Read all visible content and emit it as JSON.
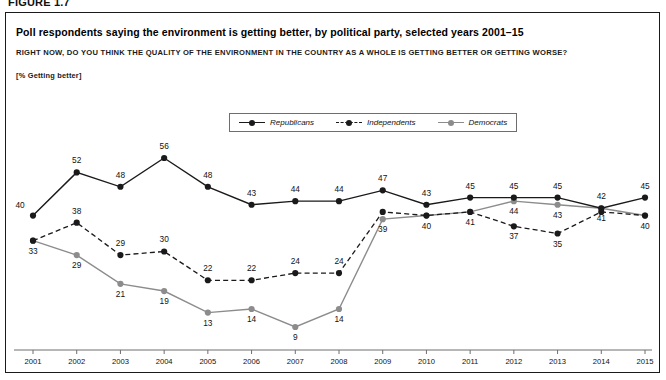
{
  "figure": {
    "label": "FIGURE 1.7",
    "title": "Poll respondents saying the environment is getting better, by political party, selected years 2001–15",
    "subtitle": "RIGHT NOW, DO YOU THINK THE QUALITY OF THE ENVIRONMENT IN THE COUNTRY AS A WHOLE IS GETTING BETTER OR GETTING WORSE?",
    "unit_note": "[% Getting better]"
  },
  "colors": {
    "republicans": "#1a1a1a",
    "independents": "#1a1a1a",
    "democrats": "#8c8c8c",
    "axis": "#6e6e6e",
    "border": "#1a1a1a",
    "text": "#111111"
  },
  "legend": {
    "position": "top-center",
    "items": [
      {
        "label": "Republicans",
        "marker": "solid-line-dot",
        "color": "#1a1a1a",
        "style": "solid"
      },
      {
        "label": "Independents",
        "marker": "dashed-line-dot",
        "color": "#1a1a1a",
        "style": "dashed"
      },
      {
        "label": "Democrats",
        "marker": "solid-line-dot",
        "color": "#8c8c8c",
        "style": "solid"
      }
    ]
  },
  "chart_data": {
    "type": "line",
    "title": "Poll respondents saying the environment is getting better, by political party, selected years 2001–15",
    "subtitle": "RIGHT NOW, DO YOU THINK THE QUALITY OF THE ENVIRONMENT IN THE COUNTRY AS A WHOLE IS GETTING BETTER OR GETTING WORSE?",
    "xlabel": "",
    "ylabel": "% Getting better",
    "x": [
      2001,
      2002,
      2003,
      2004,
      2005,
      2006,
      2007,
      2008,
      2009,
      2010,
      2011,
      2012,
      2013,
      2014,
      2015
    ],
    "categories": [
      "2001",
      "2002",
      "2003",
      "2004",
      "2005",
      "2006",
      "2007",
      "2008",
      "2009",
      "2010",
      "2011",
      "2012",
      "2013",
      "2014",
      "2015"
    ],
    "ylim": [
      0,
      60
    ],
    "grid": false,
    "y_axis_visible": false,
    "series": [
      {
        "name": "Republicans",
        "color": "#1a1a1a",
        "style": "solid",
        "values": [
          40,
          52,
          48,
          56,
          48,
          43,
          44,
          44,
          47,
          43,
          45,
          45,
          45,
          42,
          45
        ],
        "labels": [
          "40",
          "52",
          "48",
          "56",
          "48",
          "43",
          "44",
          "44",
          "47",
          "43",
          "45",
          "45",
          "45",
          "42",
          "45"
        ],
        "label_pos": [
          "left",
          "above",
          "above",
          "above",
          "above",
          "above",
          "above",
          "above",
          "above",
          "above",
          "above",
          "above",
          "above",
          "above",
          "above"
        ]
      },
      {
        "name": "Independents",
        "color": "#1a1a1a",
        "style": "dashed",
        "values": [
          33,
          38,
          29,
          30,
          22,
          22,
          24,
          24,
          41,
          40,
          41,
          37,
          35,
          41,
          40
        ],
        "labels": [
          "",
          "38",
          "29",
          "30",
          "22",
          "22",
          "24",
          "24",
          "",
          "",
          "",
          "37",
          "35",
          "",
          ""
        ],
        "label_pos": [
          "none",
          "above",
          "above",
          "above",
          "above",
          "above",
          "above",
          "above",
          "none",
          "none",
          "none",
          "below",
          "below",
          "none",
          "none"
        ]
      },
      {
        "name": "Democrats",
        "color": "#8c8c8c",
        "style": "solid",
        "values": [
          33,
          29,
          21,
          19,
          13,
          14,
          9,
          14,
          39,
          40,
          41,
          44,
          43,
          42,
          40
        ],
        "labels": [
          "33",
          "29",
          "21",
          "19",
          "13",
          "14",
          "9",
          "14",
          "39",
          "40",
          "41",
          "44",
          "43",
          "41",
          "40"
        ],
        "label_pos": [
          "below",
          "below",
          "below",
          "below",
          "below",
          "below",
          "below",
          "below",
          "below",
          "below",
          "below",
          "below",
          "below",
          "below",
          "below"
        ]
      }
    ]
  }
}
